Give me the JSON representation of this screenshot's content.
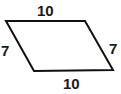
{
  "figure": {
    "name": "parallelogram-with-side-lengths",
    "shape": "parallelogram",
    "stroke_color": "#111111",
    "fill_color": "#ffffff",
    "background_color": "#ffffff",
    "stroke_width": 2,
    "vertices": [
      {
        "name": "top-left",
        "x": 6,
        "y": 21
      },
      {
        "name": "top-right",
        "x": 85,
        "y": 21
      },
      {
        "name": "bottom-right",
        "x": 113,
        "y": 70
      },
      {
        "name": "bottom-left",
        "x": 34,
        "y": 71
      }
    ],
    "labels": {
      "top": "10",
      "right": "7",
      "bottom": "10",
      "left": "7"
    }
  }
}
